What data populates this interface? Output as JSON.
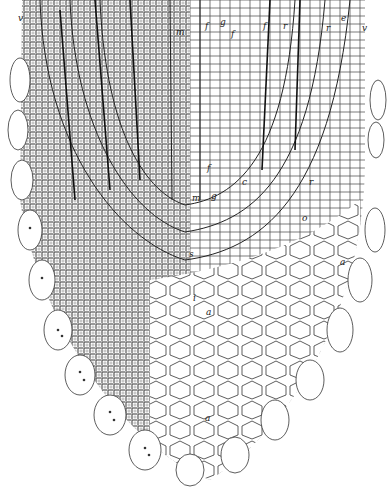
{
  "figure": {
    "background": "#ffffff",
    "ink": "#1a1a1a",
    "labels": [
      {
        "id": "v-left",
        "text": "v",
        "x": 18,
        "y": 14
      },
      {
        "id": "m-top",
        "text": "m",
        "x": 176,
        "y": 28
      },
      {
        "id": "f-top-1",
        "text": "f",
        "x": 205,
        "y": 22
      },
      {
        "id": "g-top",
        "text": "g",
        "x": 220,
        "y": 18
      },
      {
        "id": "f-top-2",
        "text": "f",
        "x": 231,
        "y": 30
      },
      {
        "id": "f-top-3",
        "text": "f",
        "x": 263,
        "y": 22
      },
      {
        "id": "r-top-1",
        "text": "r",
        "x": 283,
        "y": 22
      },
      {
        "id": "r-top-2",
        "text": "r",
        "x": 326,
        "y": 24
      },
      {
        "id": "e-top",
        "text": "e",
        "x": 341,
        "y": 14
      },
      {
        "id": "v-right",
        "text": "v",
        "x": 362,
        "y": 24
      },
      {
        "id": "f-mid",
        "text": "f",
        "x": 207,
        "y": 164
      },
      {
        "id": "m-mid",
        "text": "m",
        "x": 192,
        "y": 194
      },
      {
        "id": "g-mid",
        "text": "g",
        "x": 211,
        "y": 192
      },
      {
        "id": "c-mid",
        "text": "c",
        "x": 242,
        "y": 178
      },
      {
        "id": "r-mid",
        "text": "r",
        "x": 309,
        "y": 178
      },
      {
        "id": "o-mid",
        "text": "o",
        "x": 302,
        "y": 214
      },
      {
        "id": "s-mid",
        "text": "s",
        "x": 189,
        "y": 250
      },
      {
        "id": "a-right",
        "text": "a",
        "x": 340,
        "y": 258
      },
      {
        "id": "i-center",
        "text": "i",
        "x": 193,
        "y": 294
      },
      {
        "id": "a-center",
        "text": "a",
        "x": 206,
        "y": 308
      },
      {
        "id": "a-bottom",
        "text": "a",
        "x": 205,
        "y": 414
      }
    ]
  }
}
